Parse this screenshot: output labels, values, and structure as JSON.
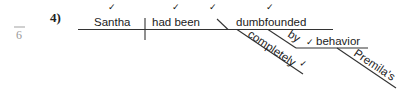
{
  "margin": {
    "page_number": "6"
  },
  "problem": {
    "number_label": "4)"
  },
  "diagram": {
    "subject": "Santha",
    "verb": "had been",
    "complement": "dumbfounded",
    "modifiers": {
      "adverb": "completely",
      "preposition": "by",
      "object_of_preposition": "behavior",
      "possessive": "Premila's"
    },
    "check_mark": "✓"
  }
}
